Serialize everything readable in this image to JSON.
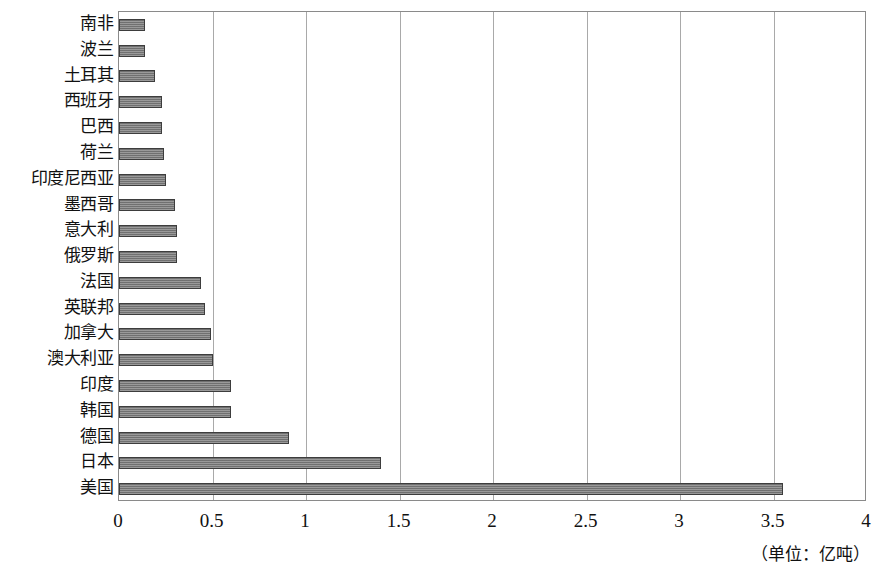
{
  "chart_data": {
    "type": "bar",
    "orientation": "horizontal",
    "title": "",
    "subtitle": "",
    "xlabel": "",
    "ylabel": "",
    "unit_caption": "（单位：亿吨）",
    "xlim": [
      0,
      4
    ],
    "xticks": [
      "0",
      "0.5",
      "1",
      "1.5",
      "2",
      "2.5",
      "3",
      "3.5",
      "4"
    ],
    "xtick_values": [
      0,
      0.5,
      1,
      1.5,
      2,
      2.5,
      3,
      3.5,
      4
    ],
    "grid": true,
    "grid_axis": "x",
    "legend": false,
    "legend_position": "none",
    "bar_color": "#7d7d7d",
    "bar_border_color": "#3d3d3d",
    "plot_border_color": "#8a8a8a",
    "gridline_color": "#a9a9a9",
    "categories": [
      "南非",
      "波兰",
      "土耳其",
      "西班牙",
      "巴西",
      "荷兰",
      "印度尼西亚",
      "墨西哥",
      "意大利",
      "俄罗斯",
      "法国",
      "英联邦",
      "加拿大",
      "澳大利亚",
      "印度",
      "韩国",
      "德国",
      "日本",
      "美国"
    ],
    "values": [
      0.14,
      0.14,
      0.19,
      0.23,
      0.23,
      0.24,
      0.25,
      0.3,
      0.31,
      0.31,
      0.44,
      0.46,
      0.49,
      0.5,
      0.6,
      0.6,
      0.91,
      1.4,
      3.55
    ]
  }
}
